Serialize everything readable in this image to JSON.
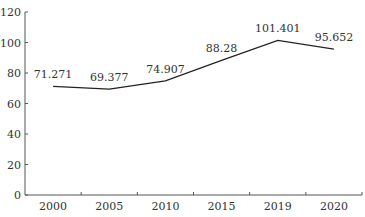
{
  "chart_data": {
    "type": "line",
    "title": "",
    "xlabel": "",
    "ylabel": "",
    "categories": [
      "2000",
      "2005",
      "2010",
      "2015",
      "2019",
      "2020"
    ],
    "values": [
      71.271,
      69.377,
      74.907,
      88.28,
      101.401,
      95.652
    ],
    "data_labels": [
      "71.271",
      "69.377",
      "74.907",
      "88.28",
      "101.401",
      "95.652"
    ],
    "ylim": [
      0,
      120
    ],
    "yticks": [
      "0",
      "20",
      "40",
      "60",
      "80",
      "100",
      "120"
    ],
    "grid": false,
    "legend": null,
    "colors": {
      "line": "#222222",
      "axis": "#555555",
      "text": "#333333"
    }
  }
}
